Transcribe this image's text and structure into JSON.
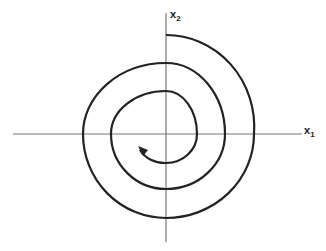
{
  "diagram": {
    "axes": {
      "x_label": "x",
      "x_sub": "1",
      "y_label": "x",
      "y_sub": "2"
    },
    "colors": {
      "axis": "#777777",
      "curve": "#222222",
      "background": "#ffffff"
    },
    "curve": {
      "type": "inward spiral",
      "direction": "clockwise toward origin",
      "arrowhead": "at inner end"
    }
  }
}
